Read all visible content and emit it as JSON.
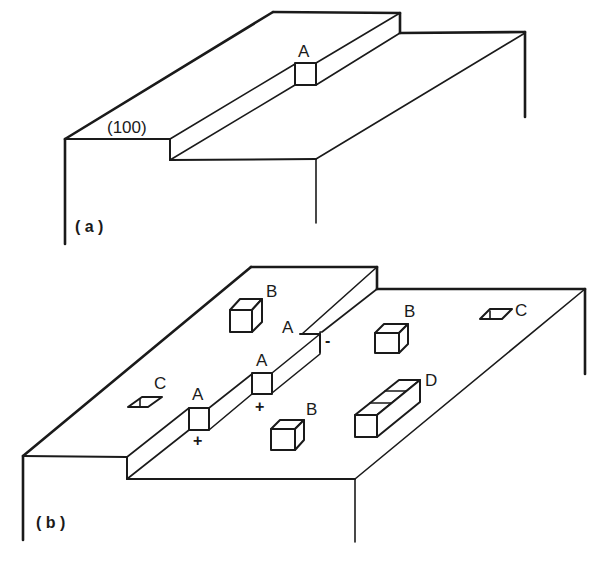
{
  "panel_a": {
    "caption": "( a )",
    "plane_label": "(100)",
    "kink_label": "A"
  },
  "panel_b": {
    "caption": "( b )",
    "kinks": [
      {
        "label": "A",
        "sign": "+"
      },
      {
        "label": "A",
        "sign": "+"
      },
      {
        "label": "A",
        "sign": "-"
      }
    ],
    "adatom_clusters": [
      {
        "label": "B"
      },
      {
        "label": "B"
      },
      {
        "label": "B"
      }
    ],
    "vacancies": [
      {
        "label": "C"
      },
      {
        "label": "C"
      }
    ],
    "row_island": {
      "label": "D"
    }
  },
  "colors": {
    "line": "#1a1a1a",
    "background": "#ffffff"
  }
}
